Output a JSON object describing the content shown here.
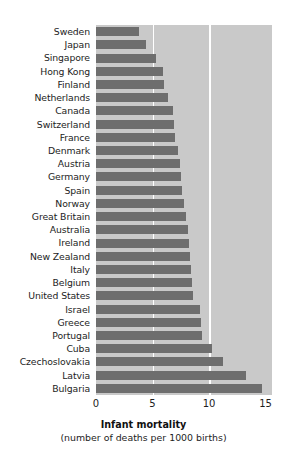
{
  "chart_data": {
    "type": "bar",
    "orientation": "horizontal",
    "title": "",
    "xlabel": "Infant mortality",
    "xlabel_sub": "(number of deaths per 1000 births)",
    "ylabel": "",
    "xlim": [
      0,
      15
    ],
    "xticks": [
      0,
      5,
      10,
      15
    ],
    "xtick_labels": [
      "0",
      "5",
      "10",
      "15"
    ],
    "grid": "vertical-white",
    "legend": "none",
    "categories": [
      "Sweden",
      "Japan",
      "Singapore",
      "Hong Kong",
      "Finland",
      "Netherlands",
      "Canada",
      "Switzerland",
      "France",
      "Denmark",
      "Austria",
      "Germany",
      "Spain",
      "Norway",
      "Great Britain",
      "Australia",
      "Ireland",
      "New Zealand",
      "Italy",
      "Belgium",
      "United States",
      "Israel",
      "Greece",
      "Portugal",
      "Cuba",
      "Czechoslovakia",
      "Latvia",
      "Bulgaria"
    ],
    "values": [
      3.8,
      4.4,
      5.3,
      5.9,
      6.0,
      6.4,
      6.8,
      6.9,
      7.0,
      7.3,
      7.4,
      7.5,
      7.6,
      7.8,
      8.0,
      8.1,
      8.2,
      8.3,
      8.4,
      8.5,
      8.6,
      9.2,
      9.3,
      9.4,
      10.3,
      11.2,
      13.3,
      14.7
    ],
    "colors": {
      "bar": "#6e6e6e",
      "plot_background": "#c9c9c9",
      "gridline": "#ffffff",
      "figure_background": "#ffffff",
      "text": "#1d1d1d"
    }
  }
}
